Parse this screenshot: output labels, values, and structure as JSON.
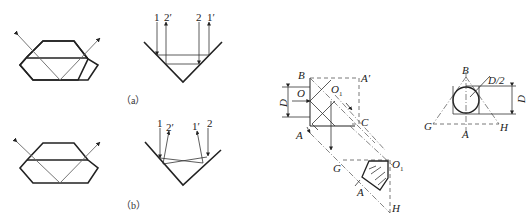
{
  "figure_a": {
    "caption": "（a）",
    "v_prism_labels": [
      "1",
      "2′",
      "2",
      "1′"
    ]
  },
  "figure_b": {
    "caption": "（b）",
    "v_prism_labels": [
      "1",
      "2′",
      "1′",
      "2"
    ]
  },
  "middle_figure": {
    "labels": {
      "B": "B",
      "A_prime": "A′",
      "O": "O",
      "O1_top": "O",
      "O1_top_sub": "1",
      "D": "D",
      "C": "C",
      "A": "A",
      "G": "G",
      "O1": "O",
      "O1_sub": "1",
      "A_lower": "A",
      "H": "H"
    }
  },
  "right_figure": {
    "labels": {
      "B": "B",
      "D_half": "D/2",
      "D": "D",
      "G": "G",
      "H": "H",
      "A": "A"
    }
  },
  "colors": {
    "stroke": "#222222",
    "ray": "#666666",
    "background": "#ffffff"
  }
}
